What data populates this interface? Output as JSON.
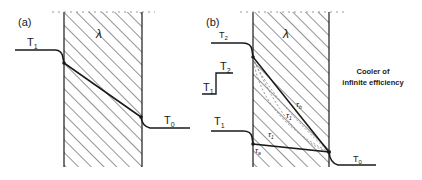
{
  "panel_a": {
    "label": "(a)",
    "material_symbol": "λ",
    "hot_temp": {
      "base": "T",
      "sub": "1"
    },
    "cold_temp": {
      "base": "T",
      "sub": "0"
    }
  },
  "panel_b": {
    "label": "(b)",
    "material_symbol": "λ",
    "top_temp": {
      "base": "T",
      "sub": "2"
    },
    "hot_temp": {
      "base": "T",
      "sub": "1"
    },
    "cold_temp": {
      "base": "T",
      "sub": "0"
    },
    "step_inset": {
      "low": {
        "base": "T",
        "sub": "1"
      },
      "high": {
        "base": "T",
        "sub": "2"
      }
    },
    "time_labels": [
      {
        "base": "τ",
        "sub": "a"
      },
      {
        "base": "τ",
        "sub": "1"
      },
      {
        "base": "τ",
        "sub": "1"
      },
      {
        "base": "τ",
        "sub": "b"
      }
    ],
    "annotation_line1": "Cooler of",
    "annotation_line2": "infinite efficiency"
  },
  "colors": {
    "line": "#1a1a1a",
    "hatch": "#2a2a2a",
    "dashed": "#888888",
    "background": "#ffffff"
  }
}
